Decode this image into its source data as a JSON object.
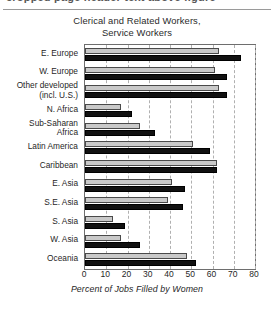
{
  "banner": {
    "ghost_text": "cropped page header text above figure"
  },
  "chart_data": {
    "type": "bar",
    "orientation": "horizontal",
    "title": "Clerical and Related Workers, Service Workers",
    "title_lines": [
      "Clerical and Related Workers,",
      "Service Workers"
    ],
    "xlabel": "Percent of Jobs Filled by Women",
    "ylabel": "",
    "xlim": [
      0,
      80
    ],
    "xticks": [
      0,
      10,
      20,
      30,
      40,
      50,
      60,
      70,
      80
    ],
    "xtick_labels": [
      "0",
      "10",
      "20",
      "30",
      "40",
      "50",
      "60",
      "70",
      "80"
    ],
    "grid": true,
    "grid_axis": "x",
    "legend": false,
    "categories": [
      "E. Europe",
      "W. Europe",
      "Other developed\n(incl. U.S.)",
      "N. Africa",
      "Sub-Saharan\nAfrica",
      "Latin America",
      "Caribbean",
      "E. Asia",
      "S.E. Asia",
      "S. Asia",
      "W. Asia",
      "Oceania"
    ],
    "series": [
      {
        "name": "Clerical and Related Workers",
        "color": "#c9c9c9",
        "values": [
          63,
          61,
          63,
          17,
          26,
          51,
          62,
          41,
          39,
          13,
          17,
          48
        ]
      },
      {
        "name": "Service Workers",
        "color": "#111111",
        "values": [
          73.5,
          67,
          67,
          22,
          33,
          59,
          62,
          47,
          46,
          19,
          26,
          52
        ]
      }
    ]
  },
  "colors": {
    "axis": "#6e6e6e",
    "gridline": "#b0b0b0",
    "light_bar": "#c9c9c9",
    "dark_bar": "#111111",
    "text": "#1f1f1f",
    "background": "#ffffff"
  }
}
